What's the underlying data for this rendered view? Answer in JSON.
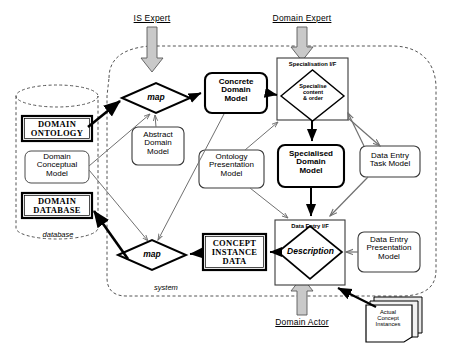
{
  "diagram": {
    "actors": [
      {
        "id": "is-expert",
        "label": "IS Expert"
      },
      {
        "id": "domain-expert",
        "label": "Domain Expert"
      },
      {
        "id": "domain-actor",
        "label": "Domain Actor"
      }
    ],
    "boundaries": [
      {
        "id": "database",
        "label": "database"
      },
      {
        "id": "system",
        "label": "system"
      }
    ],
    "store": {
      "items": [
        {
          "id": "domain-ontology",
          "label": "DOMAIN\nONTOLOGY"
        },
        {
          "id": "domain-conceptual-model",
          "label": "Domain\nConceptual\nModel"
        },
        {
          "id": "domain-database",
          "label": "DOMAIN\nDATABASE"
        }
      ]
    },
    "processes": [
      {
        "id": "map-top",
        "label": "map"
      },
      {
        "id": "map-bottom",
        "label": "map"
      },
      {
        "id": "specialise-content-order",
        "label": "Specialise\ncontent\n& order"
      },
      {
        "id": "description",
        "label": "Description"
      }
    ],
    "interfaces": [
      {
        "id": "specialisation-if",
        "label": "Specialisation I/F"
      },
      {
        "id": "data-entry-if",
        "label": "Data Entry I/F"
      }
    ],
    "models": [
      {
        "id": "concrete-domain-model",
        "label": "Concrete\nDomain\nModel"
      },
      {
        "id": "abstract-domain-model",
        "label": "Abstract\nDomain\nModel"
      },
      {
        "id": "ontology-presentation-model",
        "label": "Ontology\nPresentation\nModel"
      },
      {
        "id": "specialised-domain-model",
        "label": "Specialised\nDomain\nModel"
      },
      {
        "id": "data-entry-task-model",
        "label": "Data Entry\nTask Model"
      },
      {
        "id": "data-entry-presentation-model",
        "label": "Data Entry\nPresentation\nModel"
      }
    ],
    "data": [
      {
        "id": "concept-instance-data",
        "label": "CONCEPT\nINSTANCE\nDATA"
      },
      {
        "id": "actual-concept-instances",
        "label": "Actual\nConcept\nInstances"
      }
    ],
    "colors": {
      "stroke": "#000000",
      "fill": "#ffffff",
      "actor_arrow_fill": "#c8c8c8",
      "thin_line": "#808080",
      "dashed": "#555555"
    }
  }
}
